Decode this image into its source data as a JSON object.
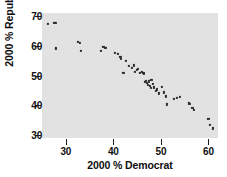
{
  "chart_data": {
    "type": "scatter",
    "title": "",
    "xlabel": "2000 % Democrat",
    "ylabel": "2000 % Republican",
    "xlim": [
      25,
      62
    ],
    "ylim": [
      29,
      71
    ],
    "xticks": [
      30,
      40,
      50,
      60
    ],
    "yticks": [
      30,
      40,
      50,
      60,
      70
    ],
    "xtick_labels": [
      "30",
      "40",
      "50",
      "60"
    ],
    "ytick_labels": [
      "30",
      "40",
      "50",
      "60",
      "70"
    ],
    "grid": false,
    "legend": null,
    "panel_background": "#e2e2e2",
    "point_color": "#2b2b2b",
    "series": [
      {
        "name": "states",
        "x": [
          26.3,
          27.6,
          27.8,
          27.9,
          28.0,
          32.6,
          33.0,
          33.1,
          37.3,
          37.9,
          38.2,
          38.4,
          40.4,
          41.0,
          41.5,
          41.6,
          42.1,
          42.6,
          43.2,
          43.9,
          44.3,
          44.6,
          45.0,
          45.2,
          45.6,
          46.0,
          46.3,
          46.5,
          46.6,
          46.9,
          47.0,
          47.2,
          47.4,
          47.6,
          47.9,
          48.0,
          48.3,
          48.6,
          48.9,
          49.1,
          49.5,
          50.2,
          50.6,
          51.0,
          51.3,
          52.7,
          53.4,
          54.0,
          55.8,
          56.1,
          56.6,
          57.0,
          60.0,
          60.3,
          61.0
        ],
        "y": [
          67.2,
          67.8,
          67.6,
          59.2,
          59.0,
          61.4,
          61.0,
          58.2,
          58.3,
          59.5,
          59.3,
          59.2,
          57.6,
          57.2,
          56.3,
          55.6,
          51.0,
          54.9,
          53.2,
          52.6,
          53.4,
          51.2,
          51.9,
          52.1,
          50.8,
          51.3,
          51.0,
          50.5,
          47.9,
          48.2,
          47.5,
          46.8,
          48.0,
          46.4,
          45.9,
          48.4,
          47.2,
          46.0,
          44.7,
          45.3,
          44.0,
          46.2,
          44.3,
          43.0,
          40.3,
          42.0,
          42.6,
          42.8,
          40.6,
          40.4,
          39.0,
          38.5,
          35.3,
          33.4,
          32.2
        ]
      }
    ]
  },
  "axis": {
    "x_title": "2000 % Democrat",
    "y_title": "2000 % Republican"
  }
}
